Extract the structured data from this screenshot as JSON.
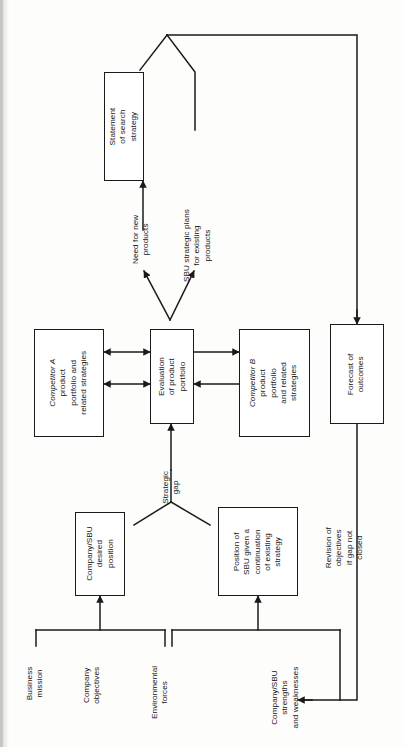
{
  "diagram": {
    "type": "flowchart",
    "orientation": "rotated-90-ccw",
    "line_color": "#1a1a1a",
    "background_color": "#fdfdfc",
    "nodes": [
      {
        "id": "statement",
        "label": "Statement\nof search\nstrategy"
      },
      {
        "id": "competitor_a",
        "label": "Competitor A\nproduct\nportfolio and\nrelated strategies"
      },
      {
        "id": "evaluation",
        "label": "Evaluation\nof product\nportfolio"
      },
      {
        "id": "competitor_b",
        "label": "Competitor B\nproduct\nportfolio\nand related\nstrategies"
      },
      {
        "id": "forecast",
        "label": "Forecast of\noutcomes"
      },
      {
        "id": "desired",
        "label": "Company/SBU\ndesired\nposition"
      },
      {
        "id": "position",
        "label": "Position of\nSBU given a\ncontinuation\nof existing\nstrategy"
      }
    ],
    "edge_labels": [
      {
        "id": "need_new",
        "label": "Need for new\nproducts"
      },
      {
        "id": "sbu_plans",
        "label": "SBU strategic plans\nfor existing\nproducts"
      },
      {
        "id": "strategic_gap",
        "label": "Strategic\ngap"
      },
      {
        "id": "revision",
        "label": "Revision of\nobjectives\nif gap not\nclosed"
      }
    ],
    "input_labels": [
      {
        "id": "business_mission",
        "label": "Business\nmission"
      },
      {
        "id": "company_objectives",
        "label": "Company\nobjectives"
      },
      {
        "id": "environmental",
        "label": "Environmental\nforces"
      },
      {
        "id": "strengths",
        "label": "Company/SBU\nstrengths\nand weaknesses"
      }
    ]
  }
}
